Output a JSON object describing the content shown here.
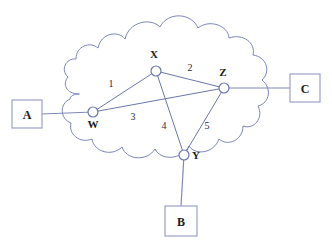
{
  "diagram": {
    "colors": {
      "background": "#ffffff",
      "cloud_stroke": "#7a85b8",
      "link_stroke": "#6b77a8",
      "external_line": "#8089b5",
      "box_stroke": "#9aa2c6",
      "text": "#1a1a1a"
    },
    "cloud": {
      "name": "network-cloud"
    },
    "nodes": [
      {
        "id": "W",
        "label": "W",
        "cx": 93,
        "cy": 112,
        "r": 5,
        "label_x": 93,
        "label_y": 128
      },
      {
        "id": "X",
        "label": "X",
        "cx": 156,
        "cy": 71,
        "r": 5,
        "label_x": 154,
        "label_y": 58
      },
      {
        "id": "Y",
        "label": "Y",
        "cx": 184,
        "cy": 155,
        "r": 5,
        "label_x": 196,
        "label_y": 159
      },
      {
        "id": "Z",
        "label": "Z",
        "cx": 224,
        "cy": 88,
        "r": 5,
        "label_x": 223,
        "label_y": 76
      }
    ],
    "links": [
      {
        "id": "1",
        "label": "1",
        "from": "W",
        "to": "X",
        "label_x": 111,
        "label_y": 87
      },
      {
        "id": "2",
        "label": "2",
        "from": "X",
        "to": "Z",
        "label_x": 190,
        "label_y": 71
      },
      {
        "id": "3",
        "label": "3",
        "from": "W",
        "to": "Z",
        "label_x": 133,
        "label_y": 120
      },
      {
        "id": "4",
        "label": "4",
        "from": "X",
        "to": "Y",
        "label_x": 164,
        "label_y": 129
      },
      {
        "id": "5",
        "label": "5",
        "from": "Z",
        "to": "Y",
        "label_x": 207,
        "label_y": 129
      }
    ],
    "external_hosts": [
      {
        "id": "A",
        "label": "A",
        "x": 12,
        "y": 100,
        "w": 30,
        "h": 28,
        "attach_to": "W",
        "line_x1": 42,
        "line_y1": 114,
        "line_x2": 93,
        "line_y2": 112
      },
      {
        "id": "C",
        "label": "C",
        "x": 290,
        "y": 74,
        "w": 30,
        "h": 28,
        "attach_to": "Z",
        "line_x1": 224,
        "line_y1": 88,
        "line_x2": 290,
        "line_y2": 88
      },
      {
        "id": "B",
        "label": "B",
        "x": 165,
        "y": 206,
        "w": 32,
        "h": 30,
        "attach_to": "Y",
        "line_x1": 184,
        "line_y1": 155,
        "line_x2": 181,
        "line_y2": 206
      }
    ]
  }
}
